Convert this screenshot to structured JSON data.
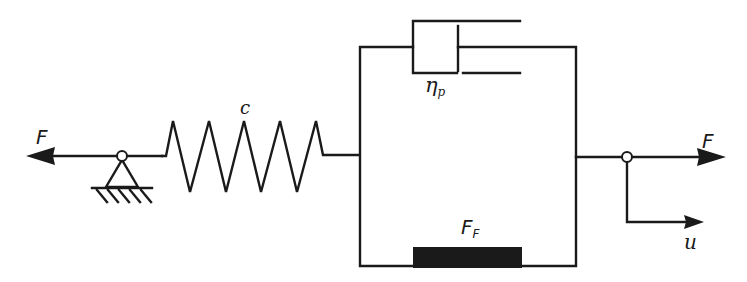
{
  "diagram": {
    "type": "rheological model",
    "colors": {
      "line": "#1a1a1a",
      "background": "#ffffff",
      "friction_block": "#1a1a1a"
    },
    "labels": {
      "force_left": "F",
      "spring": "c",
      "dashpot_symbol": "η",
      "dashpot_sub": "p",
      "friction_symbol": "F",
      "friction_sub": "F",
      "force_right": "F",
      "displacement": "u"
    },
    "elements": [
      {
        "name": "force-arrow-left",
        "label": "F",
        "direction": "left"
      },
      {
        "name": "ground-support",
        "label": ""
      },
      {
        "name": "spring",
        "label": "c"
      },
      {
        "name": "dashpot",
        "label": "ηp"
      },
      {
        "name": "friction-element",
        "label": "FF"
      },
      {
        "name": "force-arrow-right",
        "label": "F",
        "direction": "right"
      },
      {
        "name": "displacement-arrow",
        "label": "u",
        "direction": "right"
      }
    ]
  }
}
